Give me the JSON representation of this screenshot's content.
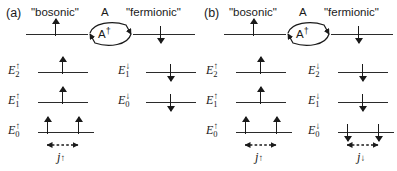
{
  "figure": {
    "width": 397,
    "height": 171,
    "background": "#ffffff",
    "line_color": "#2b2b2b",
    "text_color": "#1a1a1a"
  },
  "panels": [
    {
      "id": "a",
      "label": "(a)",
      "captions": {
        "bosonic": "\"bosonic\"",
        "operator": "A",
        "fermionic": "\"fermionic\""
      },
      "loop": {
        "top_operator": "A",
        "bottom_operator": "A",
        "bottom_operator_dagger": "†",
        "top_arrow_direction": "right",
        "bottom_arrow_direction": "left"
      },
      "top_row": {
        "left_spin": "up",
        "right_spin": "down"
      },
      "left_ladder": {
        "spin": "up",
        "levels": [
          {
            "energy": "E",
            "index": "2",
            "spin": "↑",
            "occupancy": 1
          },
          {
            "energy": "E",
            "index": "1",
            "spin": "↑",
            "occupancy": 1
          },
          {
            "energy": "E",
            "index": "0",
            "spin": "↑",
            "occupancy": 2
          }
        ],
        "coupling_label": "j",
        "coupling_spin": "↑"
      },
      "right_ladder": {
        "spin": "down",
        "levels": [
          {
            "energy": "E",
            "index": "1",
            "spin": "↓",
            "occupancy": 1
          },
          {
            "energy": "E",
            "index": "0",
            "spin": "↓",
            "occupancy": 1
          }
        ],
        "coupling_label": null,
        "coupling_spin": null
      }
    },
    {
      "id": "b",
      "label": "(b)",
      "captions": {
        "bosonic": "\"bosonic\"",
        "operator": "A",
        "fermionic": "\"fermionic\""
      },
      "loop": {
        "top_operator": "A",
        "bottom_operator": "A",
        "bottom_operator_dagger": "†",
        "top_arrow_direction": "right",
        "bottom_arrow_direction": "left"
      },
      "top_row": {
        "left_spin": "up",
        "right_spin": "down"
      },
      "left_ladder": {
        "spin": "up",
        "levels": [
          {
            "energy": "E",
            "index": "2",
            "spin": "↑",
            "occupancy": 1
          },
          {
            "energy": "E",
            "index": "1",
            "spin": "↑",
            "occupancy": 1
          },
          {
            "energy": "E",
            "index": "0",
            "spin": "↑",
            "occupancy": 2
          }
        ],
        "coupling_label": "j",
        "coupling_spin": "↑"
      },
      "right_ladder": {
        "spin": "down",
        "levels": [
          {
            "energy": "E",
            "index": "2",
            "spin": "↓",
            "occupancy": 1
          },
          {
            "energy": "E",
            "index": "1",
            "spin": "↓",
            "occupancy": 1
          },
          {
            "energy": "E",
            "index": "0",
            "spin": "↓",
            "occupancy": 2
          }
        ],
        "coupling_label": "j",
        "coupling_spin": "↓"
      }
    }
  ]
}
